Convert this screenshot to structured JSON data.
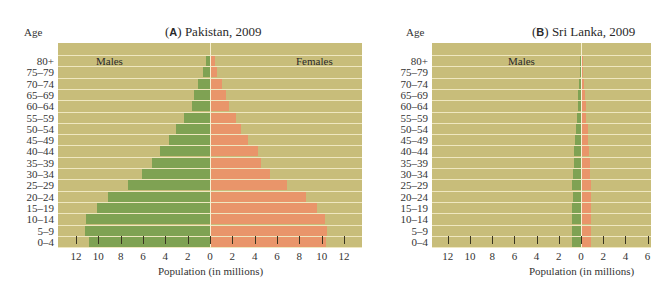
{
  "chart_data": [
    {
      "type": "bar",
      "subtype": "population-pyramid",
      "title": "(A) Pakistan, 2009",
      "title_tag": "A",
      "title_text": "Pakistan, 2009",
      "ylabel": "Age",
      "xlabel": "Population (in millions)",
      "male_label": "Males",
      "female_label": "Females",
      "categories": [
        "80+",
        "75–79",
        "70–74",
        "65–69",
        "60–64",
        "55–59",
        "50–54",
        "45–49",
        "40–44",
        "35–39",
        "30–34",
        "25–29",
        "20–24",
        "15–19",
        "10–14",
        "5–9",
        "0–4"
      ],
      "series": [
        {
          "name": "Males",
          "color": "#7fa253",
          "values": [
            0.4,
            0.6,
            1.1,
            1.4,
            1.6,
            2.3,
            3.0,
            3.7,
            4.5,
            5.2,
            6.1,
            7.3,
            9.1,
            10.1,
            11.1,
            11.2,
            10.8
          ]
        },
        {
          "name": "Females",
          "color": "#e9956a",
          "values": [
            0.4,
            0.5,
            1.0,
            1.3,
            1.6,
            2.2,
            2.7,
            3.3,
            4.2,
            4.5,
            5.3,
            6.8,
            8.5,
            9.5,
            10.2,
            10.4,
            10.3
          ]
        }
      ],
      "xticks": [
        "12",
        "10",
        "8",
        "6",
        "4",
        "2",
        "0",
        "2",
        "4",
        "6",
        "8",
        "10",
        "12"
      ],
      "xlim": [
        -13.5,
        13.5
      ],
      "grid": true,
      "background": "#c8bd7a"
    },
    {
      "type": "bar",
      "subtype": "population-pyramid",
      "title": "(B) Sri Lanka, 2009",
      "title_tag": "B",
      "title_text": "Sri Lanka, 2009",
      "ylabel": "Age",
      "xlabel": "Population (in millions)",
      "male_label": "Males",
      "categories": [
        "80+",
        "75–79",
        "70–74",
        "65–69",
        "60–64",
        "55–59",
        "50–54",
        "45–49",
        "40–44",
        "35–39",
        "30–34",
        "25–29",
        "20–24",
        "15–19",
        "10–14",
        "5–9",
        "0–4"
      ],
      "series": [
        {
          "name": "Males",
          "color": "#7fa253",
          "values": [
            0.05,
            0.1,
            0.2,
            0.25,
            0.3,
            0.4,
            0.45,
            0.5,
            0.6,
            0.65,
            0.7,
            0.8,
            0.75,
            0.8,
            0.8,
            0.8,
            0.8
          ]
        },
        {
          "name": "Females",
          "color": "#e9956a",
          "values": [
            0.05,
            0.1,
            0.2,
            0.3,
            0.35,
            0.4,
            0.5,
            0.55,
            0.6,
            0.7,
            0.75,
            0.8,
            0.8,
            0.8,
            0.8,
            0.8,
            0.8
          ]
        }
      ],
      "xticks": [
        "12",
        "10",
        "8",
        "6",
        "4",
        "2",
        "0",
        "2",
        "4",
        "6"
      ],
      "xlim": [
        -13.5,
        6.2
      ],
      "grid": true,
      "background": "#c8bd7a"
    }
  ]
}
